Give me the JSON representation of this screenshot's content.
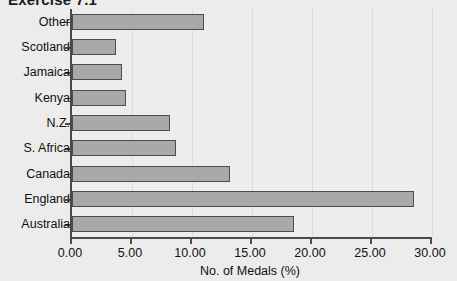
{
  "title": "Exercise 7.1",
  "chart_data": {
    "type": "bar",
    "orientation": "horizontal",
    "title": "Exercise 7.1",
    "xlabel": "No. of Medals (%)",
    "ylabel": "Country",
    "categories": [
      "Other",
      "Scotland",
      "Jamaica",
      "Kenya",
      "N.Z.",
      "S. Africa",
      "Canada",
      "England",
      "Australia"
    ],
    "values": [
      11.0,
      3.7,
      4.2,
      4.5,
      8.2,
      8.7,
      13.2,
      28.5,
      18.5
    ],
    "xlim": [
      0.0,
      30.0
    ],
    "xticks": [
      0.0,
      5.0,
      10.0,
      15.0,
      20.0,
      25.0,
      30.0
    ],
    "xtick_labels": [
      "0.00",
      "5.00",
      "10.00",
      "15.00",
      "20.00",
      "25.00",
      "30.00"
    ],
    "grid": "vertical",
    "legend": "none",
    "bar_color": "#a9a9a9",
    "bar_border_color": "#4d4d4d",
    "axis_color": "#4a4a4a",
    "background_color": "#ececec",
    "plot_background_color": "#ededed"
  }
}
